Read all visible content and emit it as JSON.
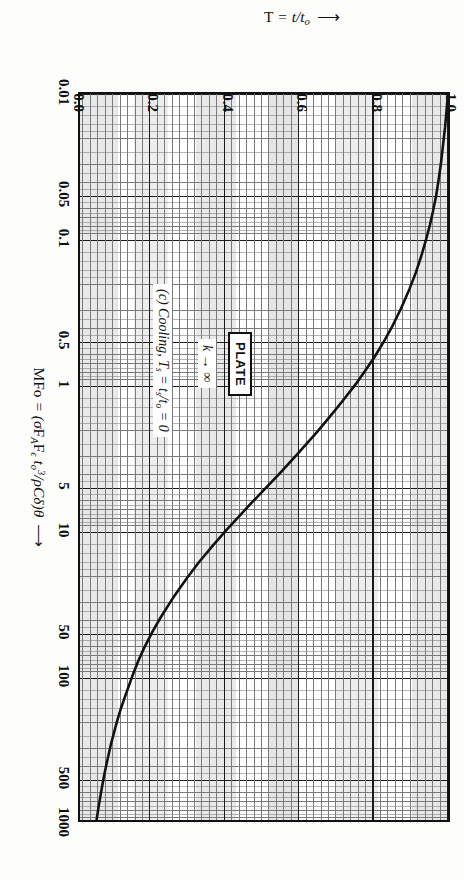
{
  "figure": {
    "plate_label": "PLATE",
    "k_note": "k → ∞",
    "case_note": "(c) Cooling, Ts = ts/to = 0"
  },
  "chart_data": {
    "type": "line",
    "title": "",
    "xlabel": "MFo = (σFA Fε to³/ρCδ)θ",
    "ylabel": "T = t/to",
    "xscale": "log",
    "yscale": "linear",
    "xlim": [
      0.01,
      1000
    ],
    "ylim": [
      0.0,
      1.0
    ],
    "grid": true,
    "legend": "none",
    "xticks": [
      {
        "value": 0.01,
        "label": "0.01"
      },
      {
        "value": 0.05,
        "label": "0.05"
      },
      {
        "value": 0.1,
        "label": "0.1"
      },
      {
        "value": 0.5,
        "label": "0.5"
      },
      {
        "value": 1,
        "label": "1"
      },
      {
        "value": 5,
        "label": "5"
      },
      {
        "value": 10,
        "label": "10"
      },
      {
        "value": 50,
        "label": "50"
      },
      {
        "value": 100,
        "label": "100"
      },
      {
        "value": 500,
        "label": "500"
      },
      {
        "value": 1000,
        "label": "1000"
      }
    ],
    "yticks": [
      {
        "value": 0.0,
        "label": "0.0"
      },
      {
        "value": 0.2,
        "label": "0.2"
      },
      {
        "value": 0.4,
        "label": "0.4"
      },
      {
        "value": 0.6,
        "label": "0.6"
      },
      {
        "value": 0.8,
        "label": "0.8"
      },
      {
        "value": 1.0,
        "label": "1.0"
      }
    ],
    "series": [
      {
        "name": "Cooling, k → ∞",
        "points": [
          [
            0.01,
            1.0
          ],
          [
            0.013,
            0.996
          ],
          [
            0.017,
            0.992
          ],
          [
            0.022,
            0.987
          ],
          [
            0.03,
            0.981
          ],
          [
            0.04,
            0.974
          ],
          [
            0.05,
            0.968
          ],
          [
            0.065,
            0.959
          ],
          [
            0.08,
            0.951
          ],
          [
            0.1,
            0.941
          ],
          [
            0.13,
            0.928
          ],
          [
            0.17,
            0.913
          ],
          [
            0.22,
            0.896
          ],
          [
            0.3,
            0.873
          ],
          [
            0.4,
            0.849
          ],
          [
            0.5,
            0.828
          ],
          [
            0.65,
            0.801
          ],
          [
            0.8,
            0.777
          ],
          [
            1.0,
            0.75
          ],
          [
            1.3,
            0.715
          ],
          [
            1.7,
            0.678
          ],
          [
            2.2,
            0.641
          ],
          [
            3.0,
            0.594
          ],
          [
            4.0,
            0.549
          ],
          [
            5.0,
            0.513
          ],
          [
            6.5,
            0.47
          ],
          [
            8.0,
            0.437
          ],
          [
            10.0,
            0.402
          ],
          [
            13.0,
            0.363
          ],
          [
            17.0,
            0.325
          ],
          [
            22.0,
            0.292
          ],
          [
            30.0,
            0.255
          ],
          [
            40.0,
            0.224
          ],
          [
            50.0,
            0.202
          ],
          [
            65.0,
            0.179
          ],
          [
            80.0,
            0.163
          ],
          [
            100.0,
            0.148
          ],
          [
            130.0,
            0.132
          ],
          [
            170.0,
            0.116
          ],
          [
            220.0,
            0.103
          ],
          [
            300.0,
            0.089
          ],
          [
            400.0,
            0.078
          ],
          [
            500.0,
            0.07
          ],
          [
            650.0,
            0.062
          ],
          [
            800.0,
            0.056
          ],
          [
            1000.0,
            0.05
          ]
        ]
      }
    ]
  }
}
